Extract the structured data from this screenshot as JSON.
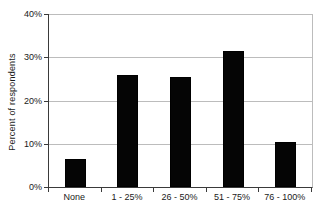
{
  "chart_data": {
    "type": "bar",
    "title": "",
    "categories": [
      "None",
      "1 - 25%",
      "26 - 50%",
      "51 - 75%",
      "76 - 100%"
    ],
    "values": [
      6.5,
      26,
      25.5,
      31.5,
      10.5
    ],
    "series": [
      {
        "name": "Percent of respondents",
        "values": [
          6.5,
          26,
          25.5,
          31.5,
          10.5
        ]
      }
    ],
    "xlabel": "",
    "ylabel": "Percent of respondents",
    "ylim": [
      0,
      40
    ],
    "yticks": [
      0,
      10,
      20,
      30,
      40
    ],
    "ytick_labels": [
      "0%",
      "10%",
      "20%",
      "30%",
      "40%"
    ],
    "grid": true,
    "legend": false,
    "legend_position": "none",
    "colors": {
      "bar": "#050505",
      "gridline": "#bcbcbc",
      "axis": "#3a3a3a",
      "text": "#1a1a1a",
      "background": "#ffffff"
    }
  }
}
